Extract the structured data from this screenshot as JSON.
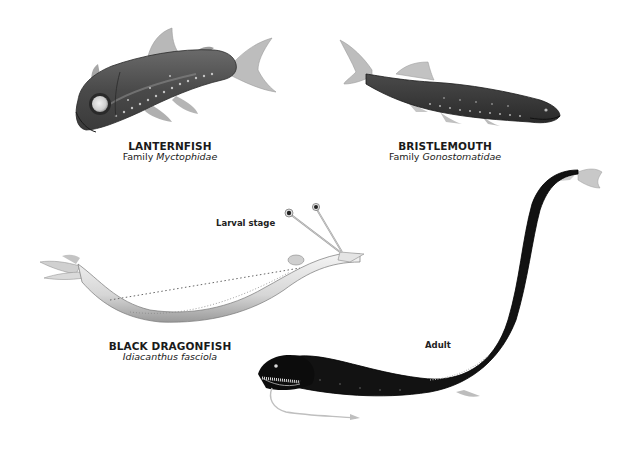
{
  "figure": {
    "background": "#ffffff",
    "specimens": [
      {
        "id": "lanternfish",
        "common_name": "LANTERNFISH",
        "family_prefix": "Family",
        "scientific_name": "Myctophidae"
      },
      {
        "id": "bristlemouth",
        "common_name": "BRISTLEMOUTH",
        "family_prefix": "Family",
        "scientific_name": "Gonostomatidae"
      },
      {
        "id": "black-dragonfish",
        "common_name": "BLACK DRAGONFISH",
        "scientific_name": "Idiacanthus fasciola",
        "stages": [
          {
            "id": "larval",
            "label": "Larval stage"
          },
          {
            "id": "adult",
            "label": "Adult"
          }
        ]
      }
    ],
    "colors": {
      "lanternfish_body": "#5a5a5a",
      "bristlemouth_body": "#3c3c3c",
      "dragonfish_adult_body": "#111111",
      "dragonfish_larva_body": "#e6e6e6",
      "text": "#1a1a1a"
    }
  }
}
